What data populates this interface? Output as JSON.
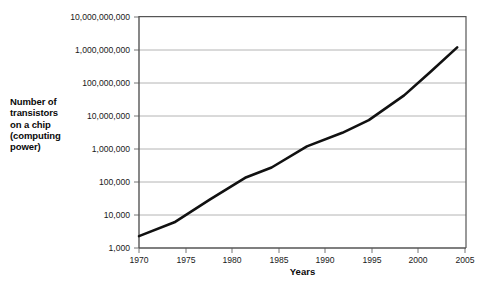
{
  "chart_data": {
    "type": "line",
    "title": "",
    "xlabel": "Years",
    "ylabel": "Number of transistors on a chip (computing power)",
    "ylabel_lines": [
      "Number of",
      "transistors",
      "on a chip",
      "(computing",
      "power)"
    ],
    "yscale": "log",
    "xlim": [
      1970,
      2007
    ],
    "ylim": [
      1000,
      10000000000
    ],
    "grid": true,
    "legend": null,
    "x_ticks": [
      1970,
      1975,
      1980,
      1985,
      1990,
      1995,
      2000,
      2005
    ],
    "x_tick_labels": [
      "1970",
      "1975",
      "1980",
      "1985",
      "1990",
      "1995",
      "2000",
      "2005"
    ],
    "y_ticks": [
      1000,
      10000,
      100000,
      1000000,
      10000000,
      100000000,
      1000000000,
      10000000000
    ],
    "y_tick_labels": [
      "1,000",
      "10,000",
      "100,000",
      "1,000,000",
      "10,000,000",
      "100,000,000",
      "1,000,000,000",
      "10,000,000,000"
    ],
    "series": [
      {
        "name": "Transistors per chip",
        "color": "#111111",
        "x": [
          1970,
          1974,
          1978,
          1982,
          1985,
          1989,
          1993,
          1996,
          2000,
          2003,
          2006
        ],
        "y": [
          2300,
          6000,
          29000,
          134000,
          275000,
          1200000,
          3100000,
          7500000,
          42000000,
          220000000,
          1200000000
        ]
      }
    ],
    "colors": {
      "line": "#111111",
      "grid": "#b4b4b4",
      "axis": "#555555",
      "text": "#111111",
      "background": "#ffffff"
    }
  }
}
